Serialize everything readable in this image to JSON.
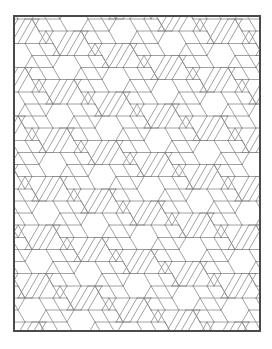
{
  "image": {
    "description": "Geometric tessellation of parallelograms forming six-pointed star/hexagon weave pattern inside a rectangular frame",
    "frame": {
      "x": 13,
      "y": 15,
      "width": 248,
      "height": 317,
      "border_color": "#4a4a4a"
    },
    "line_color": "#8a8a8a",
    "background": "#ffffff",
    "pattern": {
      "type": "hexagonal-weave",
      "edge_length": 14
    }
  }
}
